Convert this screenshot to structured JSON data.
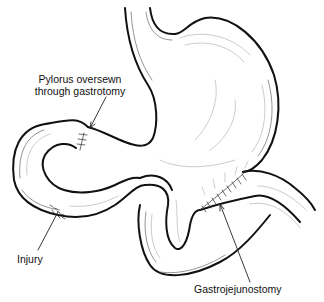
{
  "figure": {
    "labels": {
      "pylorus_line1": "Pylorus oversewn",
      "pylorus_line2": "through gastrotomy",
      "injury": "Injury",
      "gastrojejunostomy": "Gastrojejunostomy"
    },
    "colors": {
      "background": "#ffffff",
      "line": "#111111"
    }
  }
}
